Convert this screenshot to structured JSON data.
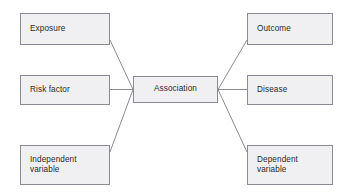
{
  "diagram": {
    "type": "concept-map",
    "style": {
      "box_fill": "#f0f0f2",
      "box_border": "#8a8a92",
      "text_color": "#2a2a2a",
      "line_color": "#8a8a92",
      "background": "#ffffff"
    },
    "center": {
      "id": "association",
      "label": "Association"
    },
    "left_nodes": [
      {
        "id": "exposure",
        "label": "Exposure"
      },
      {
        "id": "risk-factor",
        "label": "Risk factor"
      },
      {
        "id": "independent-variable",
        "label": "Independent\nvariable"
      }
    ],
    "right_nodes": [
      {
        "id": "outcome",
        "label": "Outcome"
      },
      {
        "id": "disease",
        "label": "Disease"
      },
      {
        "id": "dependent-variable",
        "label": "Dependent\nvariable"
      }
    ],
    "connectors": [
      {
        "from": "exposure",
        "to": "association",
        "kind": "diagonal"
      },
      {
        "from": "risk-factor",
        "to": "association",
        "kind": "horizontal"
      },
      {
        "from": "independent-variable",
        "to": "association",
        "kind": "diagonal"
      },
      {
        "from": "association",
        "to": "outcome",
        "kind": "diagonal"
      },
      {
        "from": "association",
        "to": "disease",
        "kind": "horizontal"
      },
      {
        "from": "association",
        "to": "dependent-variable",
        "kind": "diagonal"
      }
    ]
  }
}
